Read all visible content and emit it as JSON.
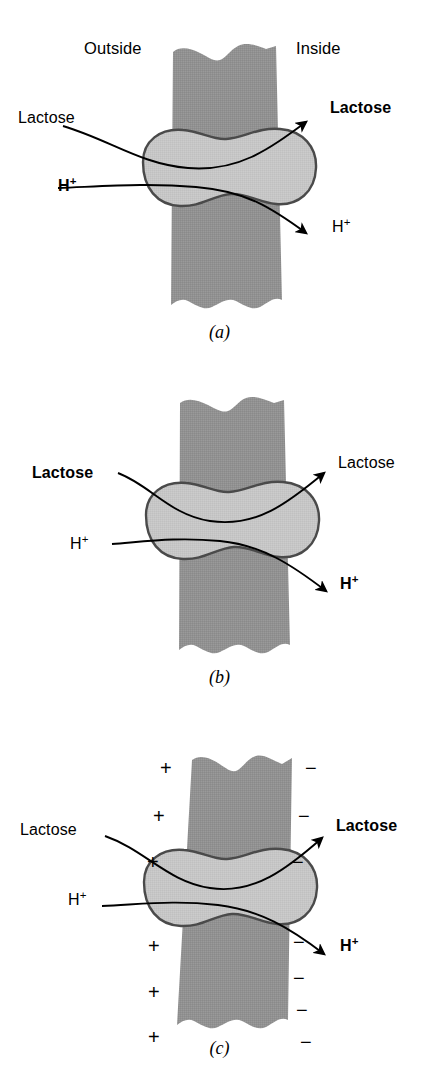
{
  "figure": {
    "colors": {
      "membrane_fill": "#919191",
      "protein_fill": "#c6c6c6",
      "outline": "#4a4a4a",
      "ink": "#000000",
      "background": "#ffffff"
    }
  },
  "panels": [
    {
      "id": "a",
      "caption": "(a)",
      "compartment_labels": {
        "outside": "Outside",
        "inside": "Inside"
      },
      "labels": {
        "left_top": {
          "text": "Lactose",
          "weight": "regular"
        },
        "left_bottom": {
          "text": "H",
          "sup": "+",
          "weight": "bold"
        },
        "right_top": {
          "text": "Lactose",
          "weight": "bold"
        },
        "right_bottom": {
          "text": "H",
          "sup": "+",
          "weight": "regular"
        }
      },
      "charges": {
        "left": [],
        "right": []
      }
    },
    {
      "id": "b",
      "caption": "(b)",
      "compartment_labels": {
        "outside": "",
        "inside": ""
      },
      "labels": {
        "left_top": {
          "text": "Lactose",
          "weight": "bold"
        },
        "left_bottom": {
          "text": "H",
          "sup": "+",
          "weight": "regular"
        },
        "right_top": {
          "text": "Lactose",
          "weight": "regular"
        },
        "right_bottom": {
          "text": "H",
          "sup": "+",
          "weight": "bold"
        }
      },
      "charges": {
        "left": [],
        "right": []
      }
    },
    {
      "id": "c",
      "caption": "(c)",
      "compartment_labels": {
        "outside": "",
        "inside": ""
      },
      "labels": {
        "left_top": {
          "text": "Lactose",
          "weight": "regular"
        },
        "left_bottom": {
          "text": "H",
          "sup": "+",
          "weight": "regular"
        },
        "right_top": {
          "text": "Lactose",
          "weight": "bold"
        },
        "right_bottom": {
          "text": "H",
          "sup": "+",
          "weight": "bold"
        }
      },
      "charges": {
        "left": [
          "+",
          "+",
          "+",
          "+",
          "+",
          "+"
        ],
        "right": [
          "−",
          "−",
          "−",
          "−",
          "−",
          "−",
          "−"
        ]
      }
    }
  ]
}
